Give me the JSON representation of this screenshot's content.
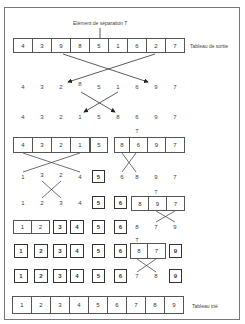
{
  "labels": {
    "pivot_label": "Elément de séparation T",
    "output_label": "Tableau de sortie",
    "sorted_label": "Tableau trié",
    "pivot_mark": "T"
  },
  "rows": {
    "row1_input": [
      "4",
      "3",
      "9",
      "8",
      "5",
      "1",
      "6",
      "2",
      "7"
    ],
    "row2": [
      "4",
      "3",
      "2",
      "8",
      "5",
      "1",
      "6",
      "9",
      "7"
    ],
    "row3": [
      "4",
      "3",
      "2",
      "1",
      "5",
      "8",
      "6",
      "9",
      "7"
    ],
    "row4_left": [
      "4",
      "3",
      "2",
      "1"
    ],
    "row4_pivot": "5",
    "row4_right": [
      "8",
      "6",
      "9",
      "7"
    ],
    "row5_left": [
      "1",
      "3",
      "2",
      "4"
    ],
    "row5_pivot": "5",
    "row5_right": [
      "6",
      "8",
      "9",
      "7"
    ],
    "row6_left": [
      "1",
      "2",
      "3",
      "4"
    ],
    "row6_fixed": [
      "5",
      "6"
    ],
    "row6_right": [
      "8",
      "9",
      "7"
    ],
    "row7_pair": [
      "1",
      "2"
    ],
    "row7_fixed": [
      "3",
      "4",
      "5",
      "6"
    ],
    "row7_right": [
      "8",
      "7",
      "9"
    ],
    "row8_fixed": [
      "1",
      "2",
      "3",
      "4",
      "5",
      "6"
    ],
    "row8_pair": [
      "8",
      "7"
    ],
    "row8_last": "9",
    "row9_fixed": [
      "1",
      "2",
      "3",
      "4",
      "5",
      "6"
    ],
    "row9_free": [
      "7",
      "8"
    ],
    "row9_last": "9",
    "row10_sorted": [
      "1",
      "2",
      "3",
      "4",
      "5",
      "6",
      "7",
      "8",
      "9"
    ]
  }
}
